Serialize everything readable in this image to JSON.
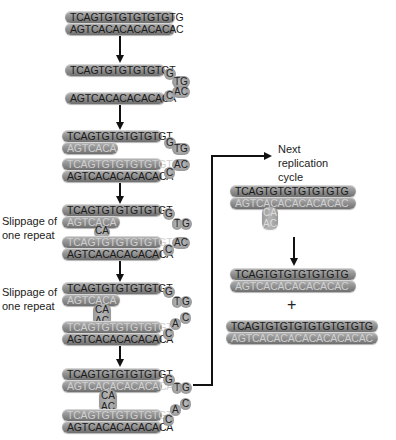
{
  "diagram": {
    "labels": {
      "slippage_1": "Slippage of one repeat",
      "slippage_2": "Slippage of one repeat",
      "next_cycle": "Next replication cycle",
      "plus": "+"
    },
    "stages": [
      {
        "top": "TCAGTGTGTGTGTGTG",
        "bottom": "AGTCACACACACACAC"
      },
      {
        "top": "TCAGTGTGTGTGTGT",
        "top_tail": [
          "G",
          "TG"
        ],
        "bottom": "AGTCACACACACACA",
        "bottom_tail": [
          "C",
          "AC"
        ]
      },
      {
        "top1": "TCAGTGTGTGTGTGT",
        "top1_tail": [
          "G",
          "TG"
        ],
        "new1": "AGTCACA",
        "new2": "TCAGTGTGTGTGTGT",
        "bottom": "AGTCACACACACACA",
        "bottom_tail": [
          "C",
          "AC"
        ]
      },
      {
        "top1": "TCAGTGTGTGTGTGT",
        "top1_tail": [
          "G",
          "T",
          "G"
        ],
        "new1": "AGTCACA",
        "loop": "CA",
        "new2": "TCAGTGTGTGTGTGT",
        "bottom": "AGTCACACACACACA",
        "bottom_tail": [
          "C",
          "AC"
        ]
      },
      {
        "top1": "TCAGTGTGTGTGTGT",
        "top1_tail": [
          "G",
          "T",
          "G"
        ],
        "new1": "AGTCACA",
        "loop": [
          "CA",
          "AC"
        ],
        "new2": "TCAGTGTGTGTGTGT",
        "bottom": "AGTCACACACACACA",
        "bottom_tail": [
          "C",
          "A",
          "C"
        ]
      },
      {
        "top1": "TCAGTGTGTGTGTGT",
        "top1_tail": [
          "G",
          "T",
          "G"
        ],
        "new1": "AGTCACACACACACA",
        "loop": [
          "CA",
          "AC"
        ],
        "new2": "TCAGTGTGTGTGTGT",
        "bottom": "AGTCACACACACACA",
        "bottom_tail": [
          "C",
          "A",
          "C"
        ]
      }
    ],
    "right_panel": {
      "loop_duplex": {
        "top": "TCAGTGTGTGTGTGTG",
        "bottom": "AGTCACACACACACAC",
        "loop": [
          "CA",
          "AC"
        ]
      },
      "result_1": {
        "top": "TCAGTGTGTGTGTGTG",
        "bottom": "AGTCACACACACACAC"
      },
      "result_2": {
        "top": "TCAGTGTGTGTGTGTGTGTG",
        "bottom": "AGTCACACACACACACACAC"
      }
    },
    "colors": {
      "strand": "#9a9a9a",
      "dark_text": "#1a1a1a",
      "light_text": "#d0d0d0",
      "arrow": "#111111"
    }
  }
}
